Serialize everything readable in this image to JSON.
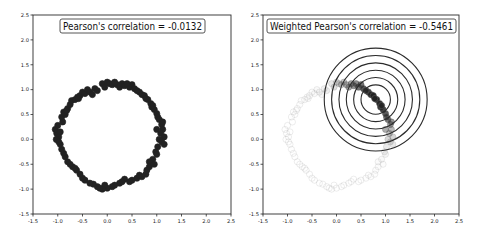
{
  "chart_data": [
    {
      "type": "scatter",
      "title": "Pearson's correlation = -0.0132",
      "xlabel": "",
      "ylabel": "",
      "xlim": [
        -1.5,
        2.5
      ],
      "ylim": [
        -1.5,
        2.5
      ],
      "xticks": [
        "-1.5",
        "-1.0",
        "-0.5",
        "0.0",
        "0.5",
        "1.0",
        "1.5",
        "2.0",
        "2.5"
      ],
      "yticks": [
        "-1.5",
        "-1.0",
        "-0.5",
        "0.0",
        "0.5",
        "1.0",
        "1.5",
        "2.0",
        "2.5"
      ],
      "grid": false,
      "weighted": false,
      "point_color": "#222222"
    },
    {
      "type": "scatter",
      "title": "Weighted Pearson's correlation = -0.5461",
      "xlabel": "",
      "ylabel": "",
      "xlim": [
        -1.5,
        2.5
      ],
      "ylim": [
        -1.5,
        2.5
      ],
      "xticks": [
        "-1.5",
        "-1.0",
        "-0.5",
        "0.0",
        "0.5",
        "1.0",
        "1.5",
        "2.0",
        "2.5"
      ],
      "yticks": [
        "-1.5",
        "-1.0",
        "-0.5",
        "0.0",
        "0.5",
        "1.0",
        "1.5",
        "2.0",
        "2.5"
      ],
      "grid": false,
      "weighted": true,
      "point_color": "#222222",
      "weight_center": [
        0.8,
        0.8
      ],
      "rings_radii": [
        0.3,
        0.45,
        0.6,
        0.75,
        0.9,
        1.05
      ]
    }
  ],
  "points": [
    [
      -1.02,
      0.12
    ],
    [
      -1.05,
      0.2
    ],
    [
      -1.0,
      0.28
    ],
    [
      -0.98,
      0.05
    ],
    [
      -1.03,
      0.0
    ],
    [
      -0.95,
      0.15
    ],
    [
      -0.9,
      0.35
    ],
    [
      -0.92,
      0.45
    ],
    [
      -0.85,
      0.5
    ],
    [
      -0.88,
      0.55
    ],
    [
      -0.8,
      0.62
    ],
    [
      -0.75,
      0.7
    ],
    [
      -0.72,
      0.78
    ],
    [
      -0.65,
      0.8
    ],
    [
      -0.6,
      0.85
    ],
    [
      -0.55,
      0.88
    ],
    [
      -0.5,
      0.95
    ],
    [
      -0.45,
      0.92
    ],
    [
      -0.4,
      1.0
    ],
    [
      -0.35,
      0.95
    ],
    [
      -0.3,
      0.9
    ],
    [
      -0.25,
      1.02
    ],
    [
      -0.2,
      0.98
    ],
    [
      -0.1,
      1.12
    ],
    [
      0.0,
      1.15
    ],
    [
      0.05,
      1.12
    ],
    [
      0.1,
      1.1
    ],
    [
      0.2,
      1.1
    ],
    [
      0.25,
      1.05
    ],
    [
      0.3,
      1.12
    ],
    [
      0.35,
      1.08
    ],
    [
      0.45,
      1.05
    ],
    [
      0.5,
      1.1
    ],
    [
      0.55,
      1.02
    ],
    [
      0.65,
      0.95
    ],
    [
      0.7,
      0.9
    ],
    [
      0.75,
      0.88
    ],
    [
      0.82,
      0.8
    ],
    [
      0.88,
      0.72
    ],
    [
      0.9,
      0.65
    ],
    [
      0.95,
      0.6
    ],
    [
      1.0,
      0.52
    ],
    [
      1.02,
      0.45
    ],
    [
      1.05,
      0.4
    ],
    [
      1.1,
      0.3
    ],
    [
      1.12,
      0.2
    ],
    [
      1.08,
      0.12
    ],
    [
      1.15,
      0.05
    ],
    [
      1.05,
      0.0
    ],
    [
      1.1,
      -0.05
    ],
    [
      1.02,
      -0.15
    ],
    [
      0.98,
      -0.25
    ],
    [
      1.0,
      -0.3
    ],
    [
      0.92,
      -0.4
    ],
    [
      0.85,
      -0.45
    ],
    [
      0.85,
      -0.55
    ],
    [
      0.8,
      -0.62
    ],
    [
      0.78,
      -0.7
    ],
    [
      0.7,
      -0.75
    ],
    [
      0.6,
      -0.78
    ],
    [
      0.5,
      -0.82
    ],
    [
      0.45,
      -0.85
    ],
    [
      0.35,
      -0.8
    ],
    [
      0.25,
      -0.88
    ],
    [
      0.15,
      -0.92
    ],
    [
      0.1,
      -0.95
    ],
    [
      0.0,
      -0.98
    ],
    [
      -0.05,
      -0.92
    ],
    [
      -0.1,
      -1.0
    ],
    [
      -0.2,
      -0.95
    ],
    [
      -0.28,
      -0.9
    ],
    [
      -0.35,
      -0.88
    ],
    [
      -0.45,
      -0.82
    ],
    [
      -0.5,
      -0.78
    ],
    [
      -0.55,
      -0.7
    ],
    [
      -0.62,
      -0.62
    ],
    [
      -0.7,
      -0.55
    ],
    [
      -0.75,
      -0.5
    ],
    [
      -0.8,
      -0.45
    ],
    [
      -0.85,
      -0.35
    ],
    [
      -0.88,
      -0.28
    ],
    [
      -0.92,
      -0.2
    ],
    [
      -0.95,
      -0.1
    ],
    [
      -0.98,
      -0.05
    ],
    [
      0.6,
      0.98
    ],
    [
      0.4,
      1.12
    ],
    [
      0.15,
      1.15
    ],
    [
      -0.05,
      1.05
    ],
    [
      1.12,
      0.35
    ],
    [
      1.15,
      -0.1
    ],
    [
      0.95,
      -0.5
    ],
    [
      0.3,
      -0.85
    ],
    [
      -0.15,
      -0.98
    ],
    [
      -0.65,
      -0.58
    ],
    [
      -0.82,
      0.58
    ],
    [
      -0.58,
      0.82
    ],
    [
      0.78,
      0.82
    ],
    [
      0.92,
      0.68
    ],
    [
      1.0,
      0.2
    ],
    [
      0.65,
      -0.72
    ]
  ],
  "axes_keys": [
    "left",
    "right"
  ]
}
